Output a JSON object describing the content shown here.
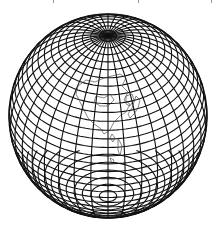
{
  "map": {
    "type": "globe-graticule",
    "projection": "tilted perspective (near-side) globe",
    "center_x": 108,
    "center_y": 116,
    "radius_x": 99,
    "radius_y": 102,
    "tilt_deg": 38,
    "parallel_step_deg": 5,
    "meridian_step_deg": 10,
    "colors": {
      "line": "#111111",
      "background": "#ffffff",
      "coast": "#333333"
    },
    "visible_features": [
      "north pole convergence",
      "south pole convergence",
      "graticule",
      "East Asia coastline (China, Korea, Japan)"
    ]
  },
  "top_marks_x": [
    53,
    138,
    211
  ]
}
